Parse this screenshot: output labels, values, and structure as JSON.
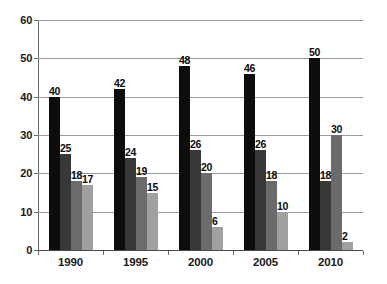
{
  "chart_data": {
    "type": "bar",
    "title": "",
    "subtitle": "",
    "xlabel": "",
    "ylabel": "",
    "categories": [
      "1990",
      "1995",
      "2000",
      "2005",
      "2010"
    ],
    "series": [
      {
        "name": "Series 1",
        "color": "#0d0d0d",
        "values": [
          40,
          42,
          48,
          46,
          50
        ]
      },
      {
        "name": "Series 2",
        "color": "#383838",
        "values": [
          25,
          24,
          26,
          26,
          18
        ]
      },
      {
        "name": "Series 3",
        "color": "#6b6b6b",
        "values": [
          18,
          19,
          20,
          18,
          30
        ]
      },
      {
        "name": "Series 4",
        "color": "#a0a0a0",
        "values": [
          17,
          15,
          6,
          10,
          2
        ]
      }
    ],
    "ylim": [
      0,
      60
    ],
    "yticks": [
      0,
      10,
      20,
      30,
      40,
      50,
      60
    ],
    "ytick_labels": [
      "0",
      "10",
      "20",
      "30",
      "40",
      "50",
      "60"
    ],
    "grid": true,
    "grid_axis": "y",
    "legend": false,
    "data_labels": true,
    "bar_value_labels": [
      [
        "40",
        "25",
        "18",
        "17"
      ],
      [
        "42",
        "24",
        "19",
        "15"
      ],
      [
        "48",
        "26",
        "20",
        "6"
      ],
      [
        "46",
        "26",
        "18",
        "10"
      ],
      [
        "50",
        "18",
        "30",
        "2"
      ]
    ],
    "background_color": "#ffffff",
    "gridline_color": "#9a9a9a",
    "axis_color": "#6a6a6a",
    "text_color": "#1a1a1a"
  }
}
